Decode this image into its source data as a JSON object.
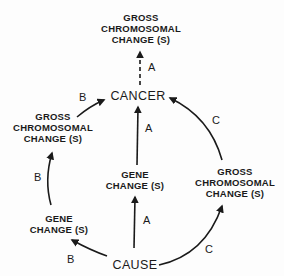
{
  "diagram": {
    "nodes": {
      "top_gross": {
        "lines": [
          "GROSS",
          "CHROMOSOMAL",
          "CHANGE (S)"
        ]
      },
      "cancer": {
        "label": "CANCER"
      },
      "left_gross": {
        "lines": [
          "GROSS",
          "CHROMOSOMAL",
          "CHANGE (S)"
        ]
      },
      "center_gene": {
        "lines": [
          "GENE",
          "CHANGE (S)"
        ]
      },
      "right_gross": {
        "lines": [
          "GROSS",
          "CHROMOSOMAL",
          "CHANGE (S)"
        ]
      },
      "left_gene": {
        "lines": [
          "GENE",
          "CHANGE (S)"
        ]
      },
      "cause": {
        "label": "CAUSE"
      }
    },
    "edge_labels": {
      "cancer_to_top_gross": "A",
      "left_gross_to_cancer": "B",
      "left_gene_to_left_gross": "B",
      "cause_to_left_gene": "B",
      "center_gene_to_cancer": "A",
      "cause_to_center_gene": "A",
      "right_gross_to_cancer": "C",
      "cause_to_right_gross": "C"
    },
    "edges": [
      {
        "from": "cancer",
        "to": "top_gross",
        "label": "A",
        "style": "dashed"
      },
      {
        "from": "left_gross",
        "to": "cancer",
        "label": "B",
        "style": "solid"
      },
      {
        "from": "left_gene",
        "to": "left_gross",
        "label": "B",
        "style": "solid"
      },
      {
        "from": "cause",
        "to": "left_gene",
        "label": "B",
        "style": "solid"
      },
      {
        "from": "center_gene",
        "to": "cancer",
        "label": "A",
        "style": "solid"
      },
      {
        "from": "cause",
        "to": "center_gene",
        "label": "A",
        "style": "solid"
      },
      {
        "from": "right_gross",
        "to": "cancer",
        "label": "C",
        "style": "solid"
      },
      {
        "from": "cause",
        "to": "right_gross",
        "label": "C",
        "style": "solid"
      }
    ],
    "colors": {
      "ink": "#1a1a1a",
      "background": "#fdfdfd"
    }
  }
}
